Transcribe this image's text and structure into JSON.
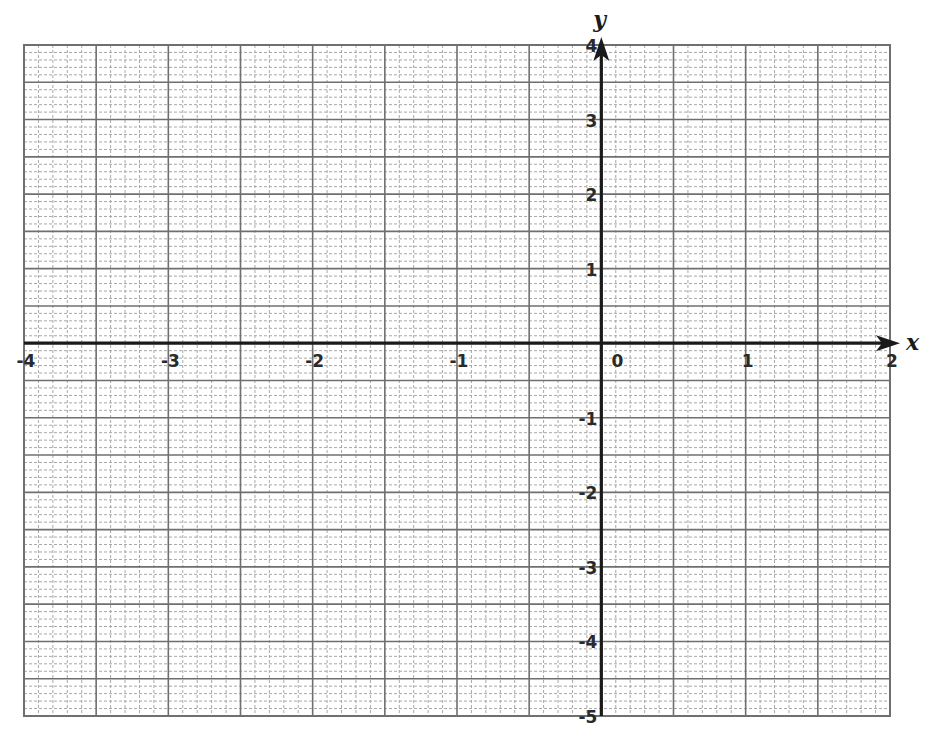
{
  "chart_data": {
    "type": "line",
    "title": "",
    "xlabel": "x",
    "ylabel": "y",
    "xlim": [
      -4,
      2
    ],
    "ylim": [
      -5,
      4
    ],
    "x_ticks": [
      -4,
      -3,
      -2,
      -1,
      0,
      1,
      2
    ],
    "x_tick_labels": [
      "-4",
      "-3",
      "-2",
      "-1",
      "0",
      "1",
      "2"
    ],
    "y_ticks": [
      4,
      3,
      2,
      1,
      -1,
      -2,
      -3,
      -4,
      -5
    ],
    "y_tick_labels": [
      "4",
      "3",
      "2",
      "1",
      "-1",
      "-2",
      "-3",
      "-4",
      "-5"
    ],
    "grid": {
      "on": true,
      "major_step": 0.5,
      "minor_step": 0.1,
      "minor_style": "dashed"
    },
    "series": [],
    "legend": null,
    "colors": {
      "axis": "#1a1a1a",
      "major_grid": "#6f6f6f",
      "minor_grid": "#a8a8a8",
      "background": "#ffffff"
    }
  },
  "layout": {
    "plot_left": 24,
    "plot_right": 890,
    "plot_top": 45,
    "plot_bottom": 716
  }
}
